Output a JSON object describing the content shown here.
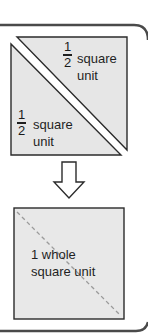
{
  "diagram": {
    "top_square": {
      "upper_triangle": {
        "fraction_numerator": "1",
        "fraction_denominator": "2",
        "label_line1": "square",
        "label_line2": "unit"
      },
      "lower_triangle": {
        "fraction_numerator": "1",
        "fraction_denominator": "2",
        "label_line1": "square",
        "label_line2": "unit"
      }
    },
    "arrow": {
      "direction": "down",
      "icon": "down-arrow-icon"
    },
    "bottom_square": {
      "label_line1": "1 whole",
      "label_line2": "square unit"
    },
    "colors": {
      "fill": "#e6e6e6",
      "stroke": "#2b2b2b",
      "frame": "#4a4a4a",
      "dashed": "#9a9a9a"
    }
  }
}
